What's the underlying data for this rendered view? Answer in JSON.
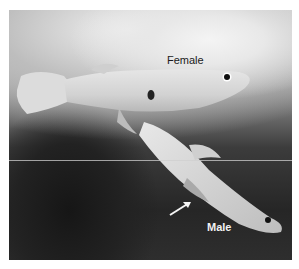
{
  "figure": {
    "labels": {
      "female": "Female",
      "male": "Male"
    },
    "subjects": [
      {
        "name": "female-fish",
        "label": "Female"
      },
      {
        "name": "male-fish",
        "label": "Male"
      }
    ],
    "annotation": {
      "type": "arrow",
      "target": "male-fish"
    }
  }
}
